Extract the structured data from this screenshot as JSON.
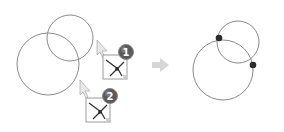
{
  "diagram": {
    "colors": {
      "circle_stroke": "#8a8a8a",
      "point_fill": "#2b2b2b",
      "arrow_fill": "#d6d6d6",
      "badge_fill": "#555555",
      "badge_text": "#ffffff",
      "icon_border": "#9a9a9a",
      "cursor_fill": "#e8e8e8"
    },
    "before": {
      "circles": [
        {
          "id": "small",
          "cx": 70,
          "cy": 38,
          "r": 23
        },
        {
          "id": "large",
          "cx": 48,
          "cy": 64,
          "r": 31
        }
      ],
      "steps": [
        {
          "badge": "1",
          "cursor": {
            "x": 97,
            "y": 40
          },
          "icon": {
            "x": 103,
            "y": 55
          }
        },
        {
          "badge": "2",
          "cursor": {
            "x": 80,
            "y": 80
          },
          "icon": {
            "x": 86,
            "y": 98
          }
        }
      ]
    },
    "after": {
      "circles": [
        {
          "id": "small",
          "cx": 238,
          "cy": 42,
          "r": 21
        },
        {
          "id": "large",
          "cx": 223,
          "cy": 70,
          "r": 30
        }
      ],
      "points": [
        {
          "x": 219,
          "y": 38
        },
        {
          "x": 253,
          "y": 65
        }
      ]
    }
  }
}
